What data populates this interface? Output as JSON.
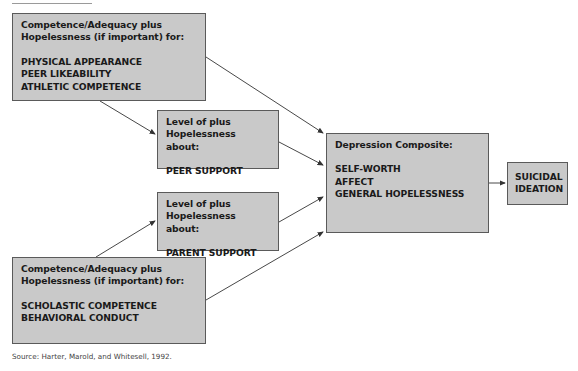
{
  "diagram": {
    "type": "path-model",
    "boxes": {
      "competence_social": {
        "heading_lines": [
          "Competence/Adequacy plus",
          "Hopelessness (if important) for:"
        ],
        "items": [
          "PHYSICAL APPEARANCE",
          "PEER LIKEABILITY",
          "ATHLETIC COMPETENCE"
        ]
      },
      "peer_support": {
        "heading_lines": [
          "Level of plus",
          "Hopelessness about:"
        ],
        "items": [
          "PEER SUPPORT"
        ]
      },
      "parent_support": {
        "heading_lines": [
          "Level of plus",
          "Hopelessness about:"
        ],
        "items": [
          "PARENT SUPPORT"
        ]
      },
      "depression": {
        "heading_lines": [
          "Depression Composite:"
        ],
        "items": [
          "SELF-WORTH",
          "AFFECT",
          "GENERAL HOPELESSNESS"
        ]
      },
      "suicidal": {
        "items": [
          "SUICIDAL",
          "IDEATION"
        ]
      },
      "competence_academic": {
        "heading_lines": [
          "Competence/Adequacy plus",
          "Hopelessness (if important) for:"
        ],
        "items": [
          "SCHOLASTIC COMPETENCE",
          "BEHAVIORAL CONDUCT"
        ]
      }
    },
    "edges": [
      {
        "from": "competence_social",
        "to": "peer_support"
      },
      {
        "from": "competence_social",
        "to": "depression"
      },
      {
        "from": "peer_support",
        "to": "depression"
      },
      {
        "from": "parent_support",
        "to": "depression"
      },
      {
        "from": "competence_academic",
        "to": "parent_support"
      },
      {
        "from": "competence_academic",
        "to": "depression"
      },
      {
        "from": "depression",
        "to": "suicidal"
      }
    ],
    "colors": {
      "box_fill": "#c9c9c9",
      "box_border": "#5a5a5a",
      "arrow": "#333333"
    }
  },
  "source": "Source: Harter, Marold, and Whitesell, 1992."
}
